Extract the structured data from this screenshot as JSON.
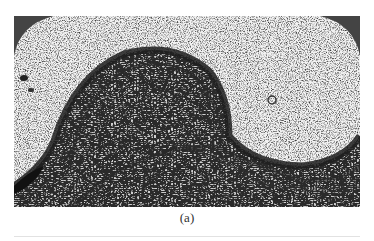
{
  "figure": {
    "caption": "(a)",
    "image_description": "grayscale micrograph showing a dark curved arch-shaped banded structure sweeping from the lower left, over a dome, into a wave toward the right, on a speckled background with dark rounded corners at the top",
    "colors": {
      "background": "#e9e9e9",
      "band": "#2a2a2a",
      "corner": "#444444"
    }
  }
}
